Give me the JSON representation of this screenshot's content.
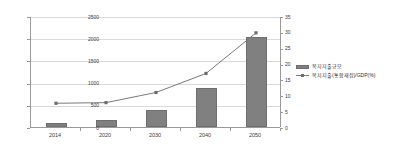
{
  "chart_data": {
    "type": "bar",
    "title": "",
    "xlabel": "",
    "ylabel": "",
    "grid": true,
    "legend_position": "right",
    "categories": [
      "2014",
      "2020",
      "2030",
      "2040",
      "2050"
    ],
    "series": [
      {
        "name": "복지지출규모",
        "type": "bar",
        "axis": "left",
        "values": [
          100,
          150,
          390,
          870,
          2020
        ],
        "color": "#808080"
      },
      {
        "name": "복지지출(통합재정)/GDP(%)",
        "type": "line",
        "axis": "right",
        "values": [
          7.8,
          8.0,
          11.2,
          17.2,
          30.0
        ],
        "color": "#7a7a7a"
      }
    ],
    "ylim": [
      0,
      2500
    ],
    "y2lim": [
      0,
      35
    ],
    "yticks": [
      0,
      500,
      1000,
      1500,
      2000,
      2500
    ],
    "y2ticks": [
      0,
      5,
      10,
      15,
      20,
      25,
      30,
      35
    ]
  },
  "axes": {
    "left_ticks": [
      "0",
      "500",
      "1000",
      "1500",
      "2000",
      "2500"
    ],
    "right_ticks": [
      "0",
      "5",
      "10",
      "15",
      "20",
      "25",
      "30",
      "35"
    ],
    "x_ticks": [
      "2014",
      "2020",
      "2030",
      "2040",
      "2050"
    ]
  },
  "legend": {
    "items": [
      {
        "label": "복지지출규모",
        "marker": "bar-swatch"
      },
      {
        "label": "복지지출(통합재정)/GDP(%)",
        "marker": "line-marker"
      }
    ]
  },
  "colors": {
    "bar": "#808080",
    "bar_border": "#6e6e6e",
    "line": "#7a7a7a",
    "gridline": "#d9d9d9",
    "axis": "#9a9a9a",
    "text": "#3a3a3a",
    "background": "#ffffff"
  }
}
